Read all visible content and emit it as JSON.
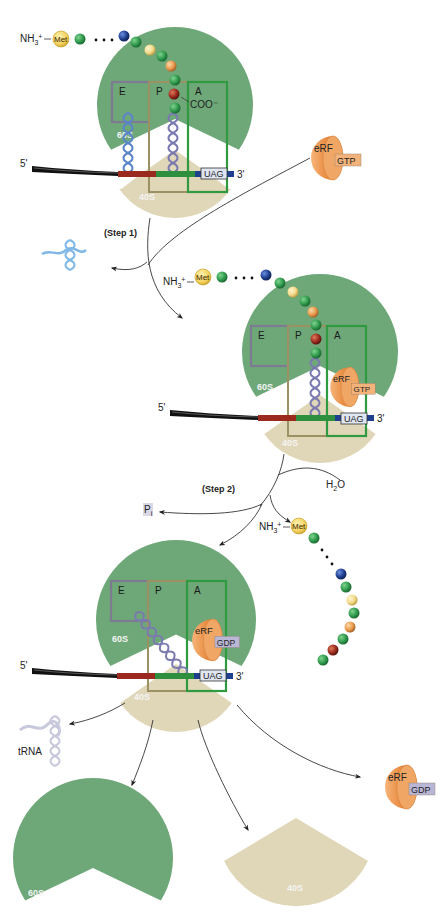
{
  "figure": {
    "colors": {
      "large_subunit": "#6fa878",
      "small_subunit": "#e0d6b8",
      "erf": "#e89a4e",
      "gtp_tag": "#f2b27a",
      "gdp_tag": "#b9b6d6",
      "uag_tag": "#dfe6f2",
      "mrna": "#111111",
      "codon_e": "#9a2a1e",
      "codon_p": "#2e8f3e",
      "codon_a": "#1f3f8f",
      "site_e": "#7d7b92",
      "site_p": "#9b9163",
      "site_a": "#2f9a3f",
      "trna_e": "#5a86c8",
      "trna_p": "#7a7ab0",
      "trna_free_blue": "#7fb8e8",
      "trna_free_grey": "#c8c8dc"
    },
    "labels": {
      "five_prime": "5'",
      "three_prime": "3'",
      "nh3": "NH3+",
      "met": "Met",
      "coo": "COO⁻",
      "site_e": "E",
      "site_p": "P",
      "site_a": "A",
      "large_subunit": "60S",
      "small_subunit": "40S",
      "stop_codon": "UAG",
      "release_factor": "eRF",
      "gtp": "GTP",
      "gdp": "GDP",
      "step1": "(Step 1)",
      "step2": "(Step 2)",
      "water": "H2O",
      "phosphate": "Pi",
      "trna": "tRNA"
    },
    "panels": [
      {
        "name": "panel-1",
        "description": "Ribosome with peptidyl-tRNA in P site and stop codon UAG in A site; free eRF·GTP"
      },
      {
        "name": "panel-2",
        "description": "eRF·GTP bound in A site; deacylated tRNA released"
      },
      {
        "name": "panel-3",
        "description": "GTP hydrolyzed to GDP, polypeptide released"
      },
      {
        "name": "panel-4",
        "description": "Dissociation into tRNA, 60S, 40S and eRF·GDP"
      }
    ]
  }
}
